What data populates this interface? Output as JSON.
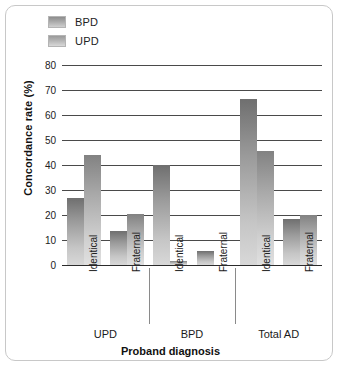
{
  "chart_data": {
    "type": "bar",
    "title": "",
    "xlabel": "Proband diagnosis",
    "ylabel": "Concordance rate (%)",
    "ylim": [
      0,
      80
    ],
    "yticks": [
      0,
      10,
      20,
      30,
      40,
      50,
      60,
      70,
      80
    ],
    "grid": true,
    "legend_position": "top-left",
    "categories": [
      "Identical",
      "Fraternal",
      "Identical",
      "Fraternal",
      "Identical",
      "Fraternal"
    ],
    "groups": [
      {
        "label": "UPD",
        "categories": [
          "Identical",
          "Fraternal"
        ]
      },
      {
        "label": "BPD",
        "categories": [
          "Identical",
          "Fraternal"
        ]
      },
      {
        "label": "Total AD",
        "categories": [
          "Identical",
          "Fraternal"
        ]
      }
    ],
    "series": [
      {
        "name": "BPD",
        "color": "#9b9b9b",
        "values": [
          27,
          13.5,
          40,
          5.5,
          66.5,
          18.5
        ]
      },
      {
        "name": "UPD",
        "color": "#b4b4b4",
        "values": [
          44,
          20.5,
          1.5,
          0,
          45.5,
          20
        ]
      }
    ]
  },
  "legend": {
    "items": [
      {
        "label": "BPD"
      },
      {
        "label": "UPD"
      }
    ]
  },
  "axes": {
    "y_title": "Concordance rate (%)",
    "x_title": "Proband diagnosis",
    "y_ticks": [
      "0",
      "10",
      "20",
      "30",
      "40",
      "50",
      "60",
      "70",
      "80"
    ]
  },
  "category_labels": [
    "Identical",
    "Fraternal",
    "Identical",
    "Fraternal",
    "Identical",
    "Fraternal"
  ],
  "group_labels": [
    "UPD",
    "BPD",
    "Total AD"
  ]
}
